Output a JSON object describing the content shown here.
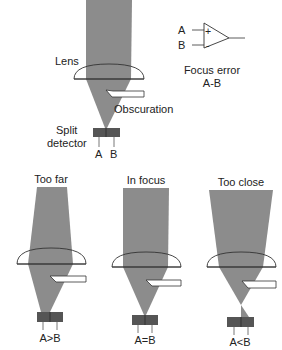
{
  "colors": {
    "beam": "#8c8c8c",
    "detector": "#555555",
    "line": "#333333",
    "background": "#ffffff"
  },
  "main_diagram": {
    "lens_label": "Lens",
    "obscuration_label": "Obscuration",
    "detector_label_line1": "Split",
    "detector_label_line2": "detector",
    "detector_a": "A",
    "detector_b": "B"
  },
  "amplifier": {
    "input_a": "A",
    "input_b": "B",
    "plus": "+",
    "minus": "-",
    "caption_line1": "Focus error",
    "caption_line2": "A-B"
  },
  "cases": [
    {
      "title": "Too far",
      "result": "A>B"
    },
    {
      "title": "In focus",
      "result": "A=B"
    },
    {
      "title": "Too close",
      "result": "A<B"
    }
  ]
}
